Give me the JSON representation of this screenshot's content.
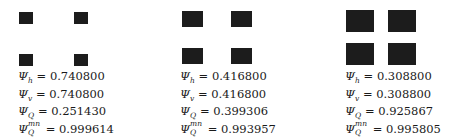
{
  "panels": [
    {
      "squares": [
        {
          "x": 19,
          "y": 12,
          "w": 14,
          "h": 12
        },
        {
          "x": 74,
          "y": 12,
          "w": 14,
          "h": 12
        },
        {
          "x": 19,
          "y": 54,
          "w": 14,
          "h": 12
        },
        {
          "x": 74,
          "y": 54,
          "w": 14,
          "h": 12
        }
      ],
      "text_x": 18,
      "text_y": 70,
      "psi_h": "0.740800",
      "psi_v": "0.740800",
      "psi_Q": "0.251430",
      "psi_Q_mn": "0.999614"
    },
    {
      "squares": [
        {
          "x": 182,
          "y": 11,
          "w": 21,
          "h": 16
        },
        {
          "x": 231,
          "y": 11,
          "w": 21,
          "h": 16
        },
        {
          "x": 182,
          "y": 48,
          "w": 21,
          "h": 16
        },
        {
          "x": 231,
          "y": 48,
          "w": 21,
          "h": 16
        }
      ],
      "text_x": 180,
      "text_y": 70,
      "psi_h": "0.416800",
      "psi_v": "0.416800",
      "psi_Q": "0.399306",
      "psi_Q_mn": "0.993957"
    },
    {
      "squares": [
        {
          "x": 346,
          "y": 10,
          "w": 28,
          "h": 22
        },
        {
          "x": 388,
          "y": 10,
          "w": 28,
          "h": 22
        },
        {
          "x": 346,
          "y": 43,
          "w": 28,
          "h": 22
        },
        {
          "x": 388,
          "y": 43,
          "w": 28,
          "h": 22
        }
      ],
      "text_x": 345,
      "text_y": 70,
      "psi_h": "0.308800",
      "psi_v": "0.308800",
      "psi_Q": "0.925867",
      "psi_Q_mn": "0.995805"
    }
  ],
  "labels": {
    "psi": "Ψ",
    "h": "h",
    "v": "v",
    "Q": "Q",
    "mn": "mn",
    "eq": " = "
  }
}
